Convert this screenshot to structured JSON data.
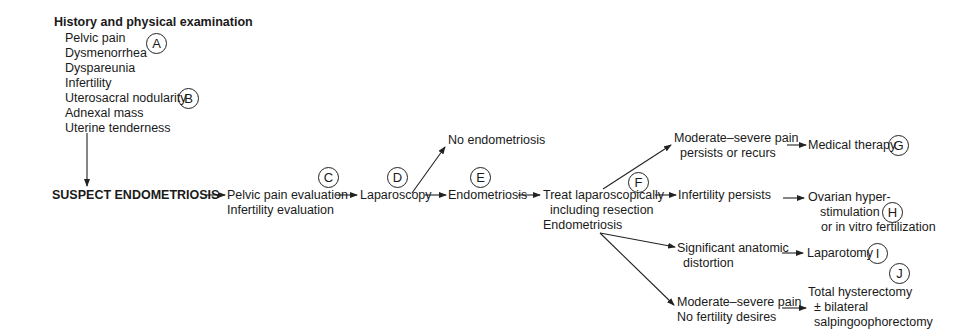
{
  "history": {
    "title": "History and physical examination",
    "items": [
      "Pelvic pain",
      "Dysmenorrhea",
      "Dyspareunia",
      "Infertility",
      "Uterosacral nodularity",
      "Adnexal mass",
      "Uterine tenderness"
    ]
  },
  "nodes": {
    "suspect": "SUSPECT ENDOMETRIOSIS",
    "evaluation_line1": "Pelvic pain evaluation",
    "evaluation_line2": "Infertility evaluation",
    "laparoscopy": "Laparoscopy",
    "no_endometriosis": "No endometriosis",
    "endometriosis": "Endometriosis",
    "treat_line1": "Treat laparoscopically",
    "treat_line2": "including resection",
    "treat_line3": "Endometriosis",
    "pain_persists_line1": "Moderate–severe pain",
    "pain_persists_line2": "persists or recurs",
    "medical_therapy": "Medical therapy",
    "infertility_persists": "Infertility persists",
    "ovarian_line1": "Ovarian hyper-",
    "ovarian_line2": "stimulation",
    "ovarian_line3": "or in vitro fertilization",
    "distortion_line1": "Significant anatomic",
    "distortion_line2": "distortion",
    "laparotomy": "Laparotomy",
    "no_fertility_line1": "Moderate–severe pain",
    "no_fertility_line2": "No fertility desires",
    "hysterectomy_line1": "Total hysterectomy",
    "hysterectomy_line2": "± bilateral",
    "hysterectomy_line3": "salpingoophorectomy"
  },
  "labels": {
    "A": "A",
    "B": "B",
    "C": "C",
    "D": "D",
    "E": "E",
    "F": "F",
    "G": "G",
    "H": "H",
    "I": "I",
    "J": "J"
  },
  "colors": {
    "line": "#222222",
    "text": "#1a1a1a",
    "background": "#ffffff"
  }
}
